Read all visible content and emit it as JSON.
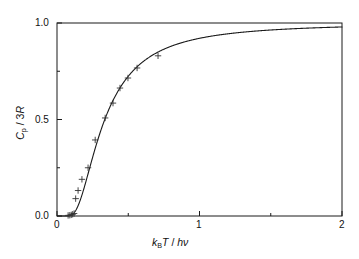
{
  "figure": {
    "name": "einstein-heat-capacity-plot",
    "background": "#ffffff",
    "frame_color": "#1a1a1a",
    "curve_color": "#1a1a1a",
    "marker_color": "#333333"
  },
  "axes": {
    "x": {
      "label_parts": {
        "k": "k",
        "B": "B",
        "T": "T",
        "slash": " / ",
        "h": "h",
        "nu": "ν"
      },
      "label_plain": "kBT / hν",
      "min": 0,
      "max": 2,
      "major_ticks": [
        0,
        1,
        2
      ],
      "major_tick_labels": [
        "0",
        "1",
        "2"
      ],
      "minor_ticks": [
        0.5,
        1.5
      ]
    },
    "y": {
      "label_parts": {
        "C": "C",
        "p": "p",
        "slash": " / 3",
        "R": "R"
      },
      "label_plain": "Cp / 3R",
      "min": 0,
      "max": 1,
      "major_ticks": [
        0.0,
        0.5,
        1.0
      ],
      "major_tick_labels": [
        "0.0",
        "0.5",
        "1.0"
      ],
      "minor_ticks": [
        0.25,
        0.75
      ]
    }
  },
  "chart_data": {
    "type": "line",
    "title": "",
    "subtitle": "",
    "xlabel": "kBT / hν",
    "ylabel": "Cp / 3R",
    "xlim": [
      0,
      2
    ],
    "ylim": [
      0,
      1
    ],
    "grid": false,
    "legend": false,
    "legend_position": "none",
    "annotations": [],
    "series": [
      {
        "name": "Einstein model curve",
        "type": "line",
        "style": "solid",
        "color": "#1a1a1a",
        "width": 1.1,
        "formula": "y = (1/x)^2 * exp(1/x) / (exp(1/x)-1)^2",
        "x": [
          0.02,
          0.04,
          0.06,
          0.08,
          0.1,
          0.12,
          0.14,
          0.16,
          0.18,
          0.2,
          0.22,
          0.24,
          0.26,
          0.28,
          0.3,
          0.32,
          0.34,
          0.36,
          0.38,
          0.4,
          0.44,
          0.48,
          0.52,
          0.56,
          0.6,
          0.65,
          0.7,
          0.75,
          0.8,
          0.9,
          1.0,
          1.1,
          1.2,
          1.3,
          1.4,
          1.5,
          1.6,
          1.7,
          1.8,
          1.9,
          2.0
        ],
        "y": [
          0.0,
          0.0,
          0.0,
          0.001,
          0.005,
          0.016,
          0.037,
          0.067,
          0.105,
          0.148,
          0.193,
          0.238,
          0.282,
          0.324,
          0.363,
          0.4,
          0.434,
          0.465,
          0.494,
          0.52,
          0.567,
          0.607,
          0.641,
          0.67,
          0.696,
          0.724,
          0.747,
          0.766,
          0.783,
          0.811,
          0.833,
          0.85,
          0.864,
          0.876,
          0.886,
          0.894,
          0.901,
          0.907,
          0.913,
          0.917,
          0.921
        ]
      },
      {
        "name": "Experimental data (diamond)",
        "type": "scatter",
        "marker": "plus",
        "color": "#333333",
        "x": [
          0.078,
          0.09,
          0.1,
          0.11,
          0.12,
          0.131,
          0.148,
          0.175,
          0.218,
          0.268,
          0.338,
          0.393,
          0.442,
          0.498,
          0.562,
          0.709
        ],
        "y": [
          0.003,
          0.004,
          0.006,
          0.009,
          0.013,
          0.09,
          0.132,
          0.19,
          0.25,
          0.394,
          0.508,
          0.585,
          0.663,
          0.715,
          0.767,
          0.83
        ]
      }
    ]
  }
}
